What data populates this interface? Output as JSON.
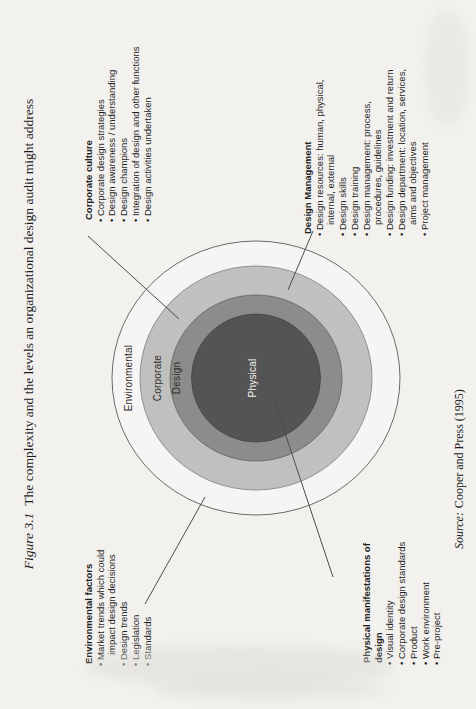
{
  "figure_caption": {
    "label": "Figure 3.1",
    "text": "The complexity and the levels an organizational design audit might address"
  },
  "source_line": {
    "label": "Source:",
    "text": "Cooper and Press (1995)"
  },
  "rings": [
    {
      "label": "Environmental",
      "fill": "#f6f5f3"
    },
    {
      "label": "Corporate",
      "fill": "#c0c0be"
    },
    {
      "label": "Design",
      "fill": "#8c8c8a"
    },
    {
      "label": "Physical",
      "fill": "#545454"
    }
  ],
  "callouts": {
    "corporate_culture": {
      "header": "Corporate culture",
      "lines": [
        "Corporate design strategies",
        "Design awareness / understanding",
        "Design champions",
        "Integration of design and other functions",
        "Design activities undertaken"
      ]
    },
    "design_management": {
      "header": "Design Management",
      "lines": [
        "Design resources: human, physical,",
        "internal, external",
        "Design skills",
        "Design training",
        "Design management: process,",
        "procedures, guidelines",
        "Design funding: investment and return",
        "Design department: location, services,",
        "aims and objectives",
        "Project management"
      ]
    },
    "environmental_factors": {
      "header": "Environmental factors",
      "lines": [
        "Market trends which could",
        "impact design decisions",
        "Design trends",
        "Legislation",
        "Standards"
      ]
    },
    "physical_manifestations": {
      "header_line1": "Physical manifestations of",
      "header_line2": "design",
      "lines": [
        "Visual identity",
        "Corporate design standards",
        "Product",
        "Work environment",
        "Pre-project"
      ]
    }
  }
}
